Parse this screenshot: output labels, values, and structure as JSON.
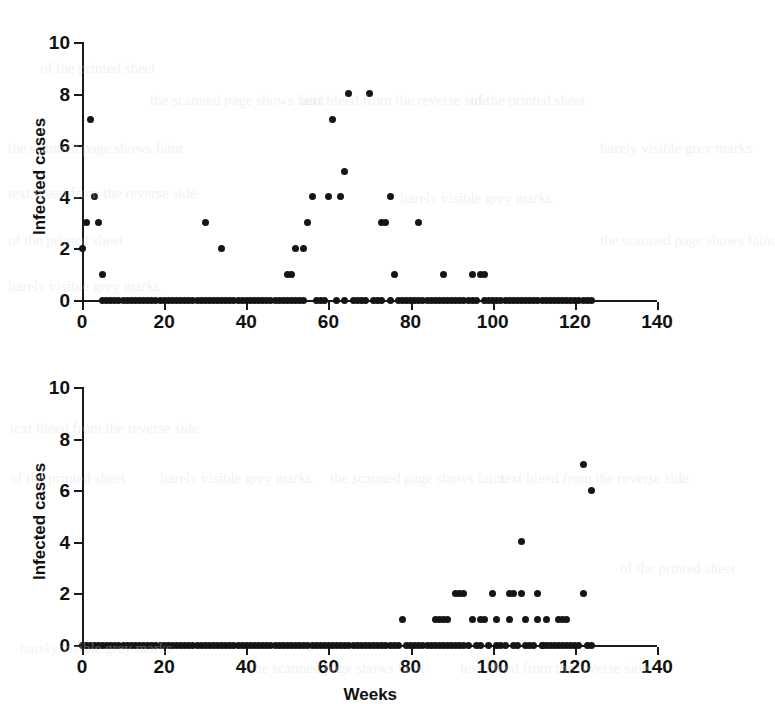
{
  "figure": {
    "background_color": "#ffffff",
    "marker_color": "#151515",
    "axis_color": "#1a1a1a"
  },
  "axis_titles": {
    "y_top": "Infected cases",
    "y_bottom": "Infected cases",
    "x_bottom": "Weeks"
  },
  "x_tick_labels": [
    "0",
    "20",
    "40",
    "60",
    "80",
    "100",
    "120",
    "140"
  ],
  "y_tick_labels": [
    "0",
    "2",
    "4",
    "6",
    "8",
    "10"
  ],
  "chart_data": [
    {
      "type": "scatter",
      "title": "",
      "panel": "top",
      "xlabel": "",
      "ylabel": "Infected cases",
      "xlim": [
        0,
        140
      ],
      "ylim": [
        0,
        10
      ],
      "xticks": [
        0,
        20,
        40,
        60,
        80,
        100,
        120,
        140
      ],
      "yticks": [
        0,
        2,
        4,
        6,
        8,
        10
      ],
      "grid": false,
      "legend": "none",
      "x": [
        0,
        1,
        2,
        3,
        4,
        5,
        5,
        6,
        7,
        8,
        9,
        10,
        11,
        12,
        13,
        14,
        15,
        16,
        17,
        18,
        19,
        20,
        21,
        22,
        23,
        24,
        25,
        26,
        27,
        28,
        29,
        30,
        30,
        31,
        32,
        33,
        34,
        34,
        35,
        36,
        37,
        38,
        39,
        40,
        41,
        42,
        43,
        44,
        45,
        46,
        47,
        48,
        49,
        50,
        50,
        51,
        51,
        52,
        52,
        53,
        54,
        54,
        55,
        56,
        57,
        58,
        59,
        60,
        61,
        62,
        63,
        64,
        64,
        65,
        66,
        67,
        68,
        69,
        70,
        71,
        72,
        73,
        73,
        74,
        75,
        75,
        76,
        77,
        78,
        79,
        80,
        81,
        82,
        82,
        83,
        84,
        85,
        86,
        87,
        88,
        88,
        89,
        90,
        91,
        92,
        93,
        94,
        95,
        95,
        96,
        97,
        98,
        98,
        99,
        100,
        101,
        102,
        103,
        104,
        105,
        106,
        107,
        108,
        109,
        110,
        111,
        112,
        113,
        114,
        115,
        116,
        117,
        118,
        119,
        120,
        121,
        122,
        123,
        124
      ],
      "y": [
        2,
        3,
        7,
        4,
        3,
        1,
        0,
        0,
        0,
        0,
        0,
        0,
        0,
        0,
        0,
        0,
        0,
        0,
        0,
        0,
        0,
        0,
        0,
        0,
        0,
        0,
        0,
        0,
        0,
        0,
        0,
        3,
        0,
        0,
        0,
        0,
        2,
        0,
        0,
        0,
        0,
        0,
        0,
        0,
        0,
        0,
        0,
        0,
        0,
        0,
        0,
        0,
        0,
        1,
        0,
        1,
        0,
        2,
        0,
        0,
        2,
        0,
        3,
        4,
        0,
        0,
        0,
        4,
        7,
        0,
        4,
        5,
        0,
        8,
        0,
        0,
        0,
        0,
        8,
        0,
        0,
        3,
        0,
        3,
        4,
        0,
        1,
        0,
        0,
        0,
        0,
        0,
        3,
        0,
        0,
        0,
        0,
        0,
        0,
        1,
        0,
        0,
        0,
        0,
        0,
        0,
        0,
        1,
        0,
        0,
        1,
        1,
        0,
        0,
        0,
        0,
        0,
        0,
        0,
        0,
        0,
        0,
        0,
        0,
        0,
        0,
        0,
        0,
        0,
        0,
        0,
        0,
        0,
        0,
        0,
        0,
        0,
        0,
        0
      ]
    },
    {
      "type": "scatter",
      "title": "",
      "panel": "bottom",
      "xlabel": "Weeks",
      "ylabel": "Infected cases",
      "xlim": [
        0,
        140
      ],
      "ylim": [
        0,
        10
      ],
      "xticks": [
        0,
        20,
        40,
        60,
        80,
        100,
        120,
        140
      ],
      "yticks": [
        0,
        2,
        4,
        6,
        8,
        10
      ],
      "grid": false,
      "legend": "none",
      "x": [
        0,
        1,
        2,
        3,
        4,
        5,
        6,
        7,
        8,
        9,
        10,
        11,
        12,
        13,
        14,
        15,
        16,
        17,
        18,
        19,
        20,
        21,
        22,
        23,
        24,
        25,
        26,
        27,
        28,
        29,
        30,
        31,
        32,
        33,
        34,
        35,
        36,
        37,
        38,
        39,
        40,
        41,
        42,
        43,
        44,
        45,
        46,
        47,
        48,
        49,
        50,
        51,
        52,
        53,
        54,
        55,
        56,
        57,
        58,
        59,
        60,
        61,
        62,
        63,
        64,
        65,
        66,
        67,
        68,
        69,
        70,
        71,
        72,
        73,
        74,
        75,
        76,
        77,
        78,
        79,
        80,
        81,
        82,
        83,
        84,
        85,
        86,
        86,
        87,
        87,
        88,
        88,
        89,
        89,
        90,
        91,
        91,
        92,
        92,
        93,
        93,
        94,
        95,
        96,
        97,
        97,
        98,
        99,
        100,
        101,
        101,
        102,
        103,
        104,
        104,
        105,
        105,
        106,
        107,
        107,
        108,
        108,
        109,
        110,
        111,
        111,
        112,
        112,
        113,
        113,
        114,
        115,
        116,
        116,
        117,
        117,
        118,
        118,
        119,
        120,
        121,
        122,
        122,
        123,
        124,
        124
      ],
      "y": [
        0,
        0,
        0,
        0,
        0,
        0,
        0,
        0,
        0,
        0,
        0,
        0,
        0,
        0,
        0,
        0,
        0,
        0,
        0,
        0,
        0,
        0,
        0,
        0,
        0,
        0,
        0,
        0,
        0,
        0,
        0,
        0,
        0,
        0,
        0,
        0,
        0,
        0,
        0,
        0,
        0,
        0,
        0,
        0,
        0,
        0,
        0,
        0,
        0,
        0,
        0,
        0,
        0,
        0,
        0,
        0,
        0,
        0,
        0,
        0,
        0,
        0,
        0,
        0,
        0,
        0,
        0,
        0,
        0,
        0,
        0,
        0,
        0,
        0,
        0,
        0,
        0,
        0,
        1,
        0,
        0,
        0,
        0,
        0,
        0,
        0,
        1,
        0,
        1,
        0,
        1,
        0,
        1,
        0,
        0,
        2,
        0,
        2,
        0,
        2,
        0,
        0,
        1,
        0,
        1,
        0,
        1,
        0,
        2,
        1,
        0,
        0,
        0,
        2,
        1,
        2,
        0,
        0,
        2,
        4,
        0,
        1,
        0,
        0,
        2,
        1,
        0,
        0,
        1,
        0,
        0,
        0,
        1,
        0,
        1,
        0,
        1,
        0,
        0,
        0,
        0,
        2,
        7,
        0,
        6,
        0
      ]
    }
  ],
  "bleed_text": {
    "lines": [
      "the scanned page shows faint",
      "text bleed from the reverse side",
      "of the printed sheet",
      "barely visible grey marks"
    ]
  }
}
